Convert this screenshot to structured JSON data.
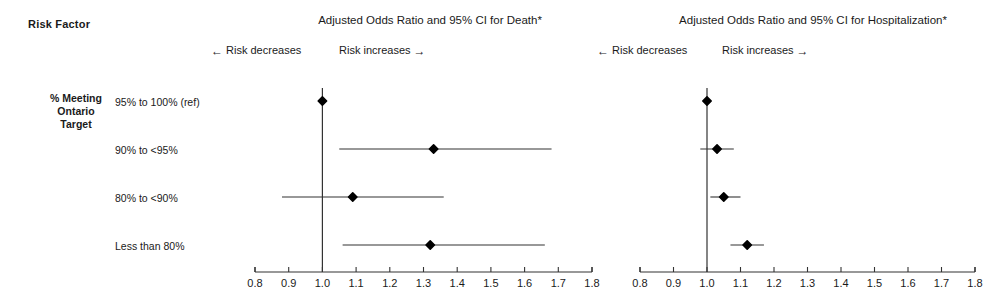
{
  "header": {
    "risk_factor_label": "Risk Factor",
    "group_label_lines": [
      "% Meeting",
      "Ontario",
      "Target"
    ]
  },
  "panels": [
    {
      "id": "death",
      "title": "Adjusted Odds Ratio and 95% CI for Death*",
      "decrease_label": "Risk decreases",
      "increase_label": "Risk increases",
      "decrease_arrow": "←",
      "increase_arrow": "→"
    },
    {
      "id": "hospitalization",
      "title": "Adjusted Odds Ratio and 95% CI for Hospitalization*",
      "decrease_label": "Risk decreases",
      "increase_label": "Risk increases",
      "decrease_arrow": "←",
      "increase_arrow": "→"
    }
  ],
  "row_labels": [
    "95% to 100% (ref)",
    "90% to <95%",
    "80% to <90%",
    "Less than 80%"
  ],
  "axis_tick_labels": [
    "0.8",
    "0.9",
    "1.0",
    "1.1",
    "1.2",
    "1.3",
    "1.4",
    "1.5",
    "1.6",
    "1.7",
    "1.8"
  ],
  "colors": {
    "ink": "#1a1a1a",
    "marker": "#000000",
    "line": "#333333",
    "background": "#ffffff"
  },
  "chart_data": {
    "type": "scatter",
    "subtype": "forest-plot",
    "xlabel": "Adjusted Odds Ratio",
    "ylabel": "% Meeting Ontario Target",
    "xlim": [
      0.8,
      1.8
    ],
    "xticks": [
      0.8,
      0.9,
      1.0,
      1.1,
      1.2,
      1.3,
      1.4,
      1.5,
      1.6,
      1.7,
      1.8
    ],
    "grid": false,
    "legend": false,
    "reference_line": 1.0,
    "categories": [
      "95% to 100% (ref)",
      "90% to <95%",
      "80% to <90%",
      "Less than 80%"
    ],
    "series": [
      {
        "name": "Adjusted Odds Ratio and 95% CI for Death*",
        "panel": "death",
        "values": [
          1.0,
          1.33,
          1.09,
          1.32
        ],
        "ci_low": [
          1.0,
          1.05,
          0.88,
          1.06
        ],
        "ci_high": [
          1.0,
          1.68,
          1.36,
          1.66
        ],
        "reference_index": 0
      },
      {
        "name": "Adjusted Odds Ratio and 95% CI for Hospitalization*",
        "panel": "hospitalization",
        "values": [
          1.0,
          1.03,
          1.05,
          1.12
        ],
        "ci_low": [
          1.0,
          0.98,
          1.01,
          1.07
        ],
        "ci_high": [
          1.0,
          1.08,
          1.1,
          1.17
        ],
        "reference_index": 0
      }
    ],
    "annotations": [
      "← Risk decreases",
      "Risk increases →"
    ],
    "footnote_marker": "*"
  }
}
